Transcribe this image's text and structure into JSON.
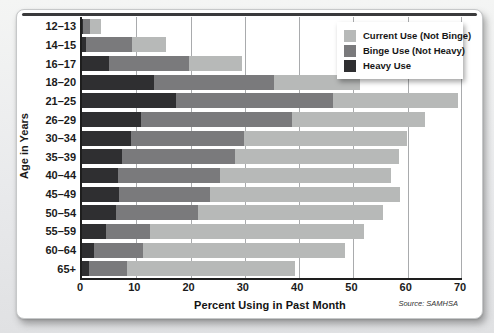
{
  "figure": {
    "source": "Source: SAMHSA"
  },
  "legend": [
    {
      "key": "current",
      "label": "Current Use (Not Binge)",
      "color": "#b7b9b8"
    },
    {
      "key": "binge",
      "label": "Binge Use (Not Heavy)",
      "color": "#7a7a7c"
    },
    {
      "key": "heavy",
      "label": "Heavy Use",
      "color": "#2f2f31"
    }
  ],
  "chart_data": {
    "type": "bar",
    "orientation": "horizontal",
    "stacked": true,
    "title": "",
    "xlabel": "Percent Using in Past Month",
    "ylabel": "Age in Years",
    "xlim": [
      0,
      70
    ],
    "x_ticks": [
      0,
      10,
      20,
      30,
      40,
      50,
      60,
      70
    ],
    "grid": "vertical",
    "legend_position": "top-right",
    "categories": [
      "12–13",
      "14–15",
      "16–17",
      "18–20",
      "21–25",
      "26–29",
      "30–34",
      "35–39",
      "40–44",
      "45–49",
      "50–54",
      "55–59",
      "60–64",
      "65+"
    ],
    "series": [
      {
        "key": "heavy",
        "name": "Heavy Use",
        "color": "#2f2f31",
        "values": [
          0.2,
          0.8,
          4.9,
          13.3,
          17.3,
          10.9,
          9.0,
          7.3,
          6.7,
          6.8,
          6.3,
          4.5,
          2.3,
          1.3
        ]
      },
      {
        "key": "binge",
        "name": "Binge Use (Not Heavy)",
        "color": "#7a7a7c",
        "values": [
          1.3,
          8.5,
          14.8,
          22.1,
          28.9,
          27.8,
          20.8,
          20.9,
          18.8,
          16.7,
          15.0,
          8.1,
          9.0,
          6.9
        ]
      },
      {
        "key": "current",
        "name": "Current Use (Not Binge)",
        "color": "#b7b9b8",
        "values": [
          2.0,
          6.2,
          9.8,
          15.9,
          23.0,
          24.4,
          30.1,
          30.2,
          31.5,
          35.1,
          34.2,
          39.4,
          37.2,
          31.1
        ]
      }
    ],
    "totals": [
      3.5,
      15.5,
      29.5,
      51.3,
      69.2,
      63.1,
      59.9,
      58.4,
      57.0,
      58.6,
      55.5,
      52.0,
      48.5,
      39.3
    ]
  }
}
